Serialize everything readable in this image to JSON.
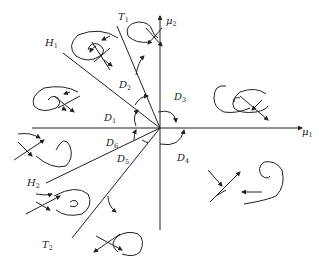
{
  "diagram": {
    "type": "bifurcation-diagram",
    "axes": {
      "x_label": "μ",
      "x_sub": "1",
      "y_label": "μ",
      "y_sub": "2"
    },
    "curves": [
      {
        "id": "H1",
        "label": "H",
        "sub": "1"
      },
      {
        "id": "T1",
        "label": "T",
        "sub": "1"
      },
      {
        "id": "H2",
        "label": "H",
        "sub": "2"
      },
      {
        "id": "T2",
        "label": "T",
        "sub": "2"
      }
    ],
    "regions": [
      {
        "id": "D1",
        "label": "D",
        "sub": "1"
      },
      {
        "id": "D2",
        "label": "D",
        "sub": "2"
      },
      {
        "id": "D3",
        "label": "D",
        "sub": "3"
      },
      {
        "id": "D4",
        "label": "D",
        "sub": "4"
      },
      {
        "id": "D5",
        "label": "D",
        "sub": "5"
      },
      {
        "id": "D6",
        "label": "D",
        "sub": "6"
      }
    ],
    "colors": {
      "stroke": "#222222",
      "background": "#ffffff"
    }
  }
}
